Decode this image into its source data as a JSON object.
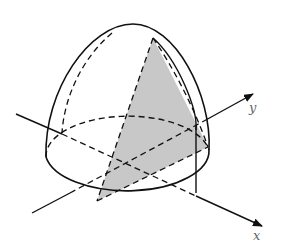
{
  "diagram": {
    "type": "3d-solid-figure",
    "axes": [
      {
        "name": "x",
        "label": "x"
      },
      {
        "name": "y",
        "label": "y"
      }
    ],
    "colors": {
      "stroke": "#111111",
      "shade": "#c8c8c8",
      "label": "#666666",
      "background": "#ffffff"
    }
  }
}
